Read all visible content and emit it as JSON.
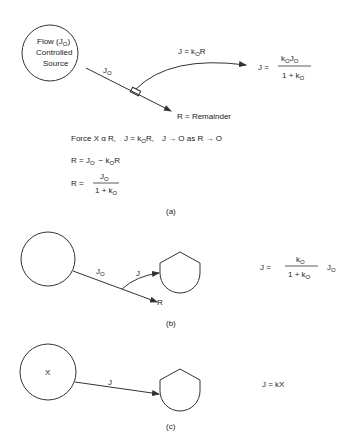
{
  "panel_a": {
    "source_label_1": "Flow (J",
    "source_label_1_sub": "O",
    "source_label_1_end": ")",
    "source_label_2": "Controlled",
    "source_label_3": "Source",
    "flow_label": "J",
    "flow_label_sub": "O",
    "branch_label": "J = k",
    "branch_label_sub": "O",
    "branch_label_end": "R",
    "remainder_label": "R = Remainder",
    "result_lhs": "J =",
    "result_num_k": "k",
    "result_num_k_sub": "O",
    "result_num_j": "J",
    "result_num_j_sub": "O",
    "result_den": "1 + k",
    "result_den_sub": "O",
    "force_line": {
      "p1": "Force  X α R,",
      "p2": "J = k",
      "p2_sub": "O",
      "p2_end": "R,",
      "p3": "J → O  as  R → O"
    },
    "eq1_lhs": "R = J",
    "eq1_sub1": "O",
    "eq1_mid": "−  k",
    "eq1_sub2": "O",
    "eq1_end": "R",
    "eq2_lhs": "R =",
    "eq2_num": "J",
    "eq2_num_sub": "O",
    "eq2_den": "1 + k",
    "eq2_den_sub": "O",
    "caption": "(a)"
  },
  "panel_b": {
    "flow_label": "J",
    "flow_label_sub": "O",
    "branch_label": "J",
    "remainder_label": "R",
    "eq_lhs": "J =",
    "eq_num": "k",
    "eq_num_sub": "O",
    "eq_den": "1 + k",
    "eq_den_sub": "O",
    "eq_rhs": "J",
    "eq_rhs_sub": "O",
    "caption": "(b)"
  },
  "panel_c": {
    "source_label": "X",
    "flow_label": "J",
    "eq": "J = kX",
    "caption": "(c)"
  }
}
